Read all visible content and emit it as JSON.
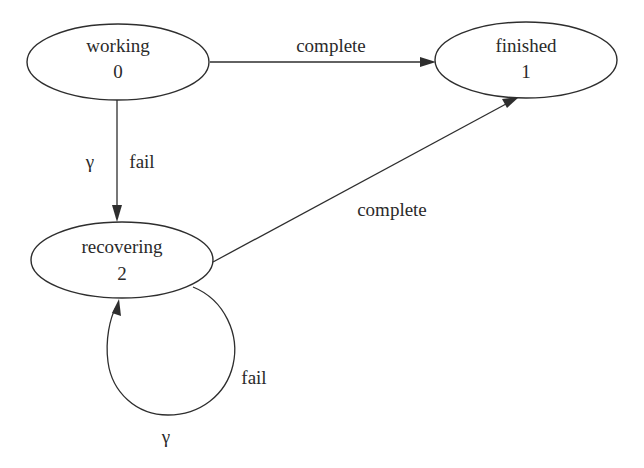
{
  "diagram": {
    "type": "state-transition",
    "states": [
      {
        "id": "working",
        "name": "working",
        "number": "0"
      },
      {
        "id": "finished",
        "name": "finished",
        "number": "1"
      },
      {
        "id": "recovering",
        "name": "recovering",
        "number": "2"
      }
    ],
    "edges": [
      {
        "from": "working",
        "to": "finished",
        "label": "complete",
        "rate": ""
      },
      {
        "from": "working",
        "to": "recovering",
        "label": "fail",
        "rate": "γ"
      },
      {
        "from": "recovering",
        "to": "finished",
        "label": "complete",
        "rate": ""
      },
      {
        "from": "recovering",
        "to": "recovering",
        "label": "fail",
        "rate": "γ"
      }
    ],
    "colors": {
      "line": "#2e2e2e",
      "text": "#2a2a2a",
      "background": "#ffffff"
    }
  }
}
